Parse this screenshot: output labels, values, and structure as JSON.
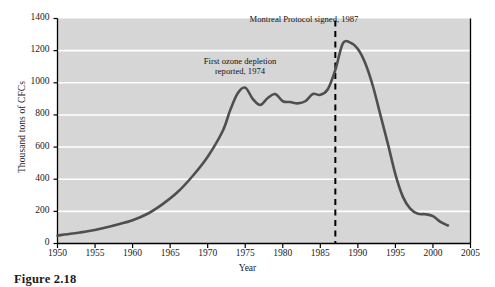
{
  "figure": {
    "caption": "Figure 2.18"
  },
  "chart_data": {
    "type": "line",
    "title": "",
    "xlabel": "Year",
    "ylabel": "Thousand tons of CFCs",
    "xlim": [
      1950,
      2005
    ],
    "ylim": [
      0,
      1400
    ],
    "xticks": [
      1950,
      1955,
      1960,
      1965,
      1970,
      1975,
      1980,
      1985,
      1990,
      1995,
      2000,
      2005
    ],
    "yticks": [
      0,
      200,
      400,
      600,
      800,
      1000,
      1200,
      1400
    ],
    "grid": "horizontal",
    "legend": "none",
    "plot_background": "#d6d6d6",
    "gridline_color": "#ffffff",
    "line_color": "#4f4f4f",
    "line_width": 2.6,
    "series": [
      {
        "name": "CFC production",
        "x": [
          1950,
          1952,
          1954,
          1956,
          1958,
          1960,
          1962,
          1964,
          1966,
          1968,
          1970,
          1972,
          1973,
          1974,
          1975,
          1976,
          1977,
          1978,
          1979,
          1980,
          1981,
          1982,
          1983,
          1984,
          1985,
          1986,
          1987,
          1988,
          1989,
          1990,
          1991,
          1992,
          1993,
          1994,
          1995,
          1996,
          1997,
          1998,
          1999,
          2000,
          2001,
          2002
        ],
        "y": [
          50,
          62,
          76,
          95,
          118,
          145,
          185,
          245,
          320,
          420,
          540,
          700,
          830,
          935,
          970,
          900,
          862,
          905,
          930,
          885,
          880,
          872,
          885,
          930,
          925,
          960,
          1080,
          1245,
          1250,
          1210,
          1120,
          980,
          800,
          620,
          430,
          290,
          215,
          185,
          182,
          170,
          135,
          112
        ]
      }
    ],
    "annotations": [
      {
        "name": "first-ozone-depletion",
        "text": "First ozone depletion\nreported, 1974",
        "year": 1974,
        "value": 1120
      },
      {
        "name": "montreal-protocol",
        "text": "Montreal Protocol signed, 1987",
        "year": 1987,
        "value": 1380
      }
    ],
    "reference_lines": [
      {
        "name": "montreal-protocol-1987",
        "orientation": "vertical",
        "year": 1987,
        "style": "dashed",
        "color": "#000000"
      }
    ]
  }
}
